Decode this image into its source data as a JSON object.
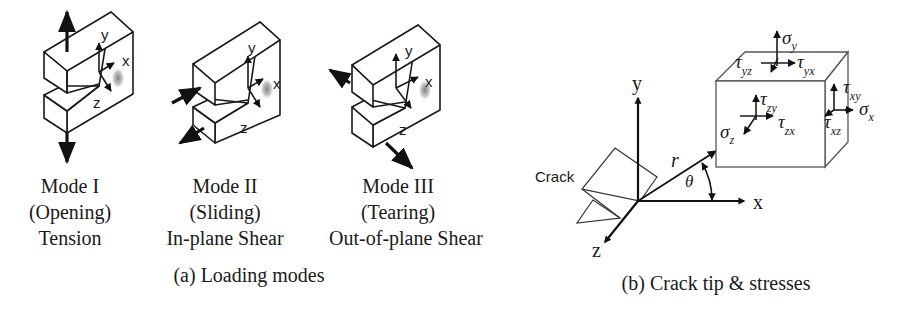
{
  "figure": {
    "panel_a": {
      "caption": "(a) Loading modes",
      "modes": [
        {
          "name": "Mode I",
          "type": "(Opening)",
          "load": "Tension",
          "axes": {
            "x": "x",
            "y": "y",
            "z": "z"
          }
        },
        {
          "name": "Mode II",
          "type": "(Sliding)",
          "load": "In-plane Shear",
          "axes": {
            "x": "x",
            "y": "y",
            "z": "z"
          }
        },
        {
          "name": "Mode III",
          "type": "(Tearing)",
          "load": "Out-of-plane Shear",
          "axes": {
            "x": "x",
            "y": "y",
            "z": "z"
          }
        }
      ]
    },
    "panel_b": {
      "caption": "(b) Crack tip & stresses",
      "crack_label": "Crack",
      "axes": {
        "x": "x",
        "y": "y",
        "z": "z"
      },
      "polar": {
        "r": "r",
        "theta": "θ"
      },
      "stresses": {
        "sigma_y": {
          "sym": "σ",
          "sub": "y"
        },
        "tau_yz": {
          "sym": "τ",
          "sub": "yz"
        },
        "tau_yx": {
          "sym": "τ",
          "sub": "yx"
        },
        "tau_xy": {
          "sym": "τ",
          "sub": "xy"
        },
        "sigma_x": {
          "sym": "σ",
          "sub": "x"
        },
        "tau_xz": {
          "sym": "τ",
          "sub": "xz"
        },
        "tau_zy": {
          "sym": "τ",
          "sub": "zy"
        },
        "tau_zx": {
          "sym": "τ",
          "sub": "zx"
        },
        "sigma_z": {
          "sym": "σ",
          "sub": "z"
        }
      }
    },
    "colors": {
      "ink": "#1a1a1a",
      "cube_edge": "#555555",
      "shadow": "#8a8a8a",
      "background": "#ffffff"
    }
  }
}
